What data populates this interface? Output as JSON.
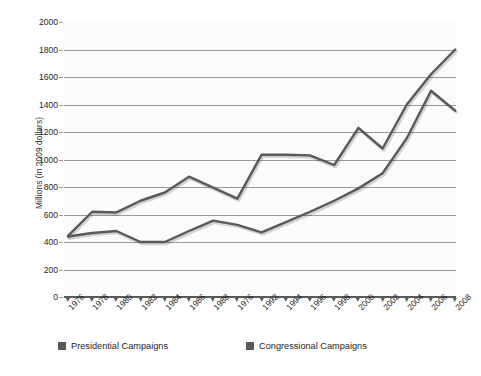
{
  "chart_data": {
    "type": "line",
    "title": "",
    "xlabel": "",
    "ylabel": "Millions (in 2009 dollars)",
    "ylim": [
      0,
      2000
    ],
    "ytick_labels": [
      "2000",
      "1800",
      "1600",
      "1400",
      "1200",
      "1000",
      "800",
      "600",
      "400",
      "200",
      "0"
    ],
    "ytick_values": [
      2000,
      1800,
      1600,
      1400,
      1200,
      1000,
      800,
      600,
      400,
      200,
      0
    ],
    "grid": true,
    "legend_position": "bottom-left",
    "categories": [
      "1976",
      "1978",
      "1980",
      "1982",
      "1984",
      "1986",
      "1988",
      "1976",
      "1992",
      "1994",
      "1996",
      "1998",
      "2000",
      "2002",
      "2004",
      "2006",
      "2008"
    ],
    "series": [
      {
        "name": "Presidential Campaigns",
        "color": "#58595b",
        "values": [
          445,
          620,
          615,
          700,
          760,
          875,
          795,
          715,
          1035,
          1035,
          1030,
          960,
          1230,
          1080,
          1400,
          1620,
          1800
        ]
      },
      {
        "name": "Congressional Campaigns",
        "color": "#58595b",
        "values": [
          440,
          465,
          480,
          400,
          400,
          480,
          555,
          525,
          470,
          545,
          620,
          700,
          790,
          900,
          1155,
          1500,
          1355
        ]
      }
    ]
  },
  "legend": {
    "items": [
      {
        "label": "Presidential Campaigns",
        "color": "#58595b"
      },
      {
        "label": "Congressional Campaigns",
        "color": "#58595b"
      }
    ]
  }
}
